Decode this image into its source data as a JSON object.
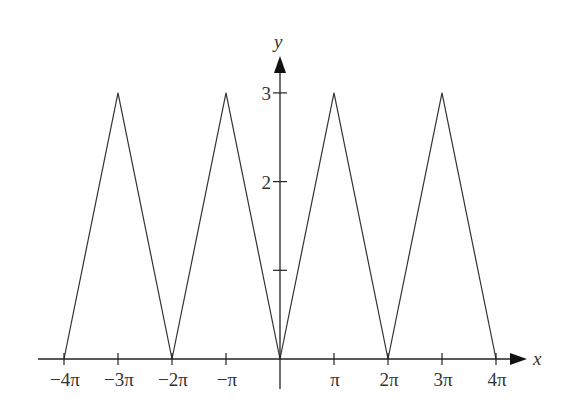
{
  "chart_data": {
    "type": "line",
    "title": "",
    "xlabel": "x",
    "ylabel": "y",
    "x_unit": "pi",
    "x": [
      -4,
      -3,
      -2,
      -1,
      0,
      1,
      2,
      3,
      4
    ],
    "series": [
      {
        "name": "triangle wave",
        "x": [
          -4,
          -3,
          -2,
          -1,
          0,
          1,
          2,
          3,
          4
        ],
        "values": [
          0,
          3,
          0,
          3,
          0,
          3,
          0,
          3,
          0
        ]
      }
    ],
    "xlim": [
      -4.3,
      4.25
    ],
    "ylim": [
      0,
      3.4
    ],
    "x_ticks": [
      -4,
      -3,
      -2,
      -1,
      1,
      2,
      3,
      4
    ],
    "x_tick_labels": [
      "−4π",
      "−3π",
      "−2π",
      "−π",
      "π",
      "2π",
      "3π",
      "4π"
    ],
    "y_ticks": [
      1,
      2,
      3
    ],
    "y_tick_labels": [
      "",
      "2",
      "3"
    ],
    "grid": false,
    "legend": "none"
  },
  "colors": {
    "axis": "#222222",
    "line": "#333333",
    "text": "#333333"
  }
}
